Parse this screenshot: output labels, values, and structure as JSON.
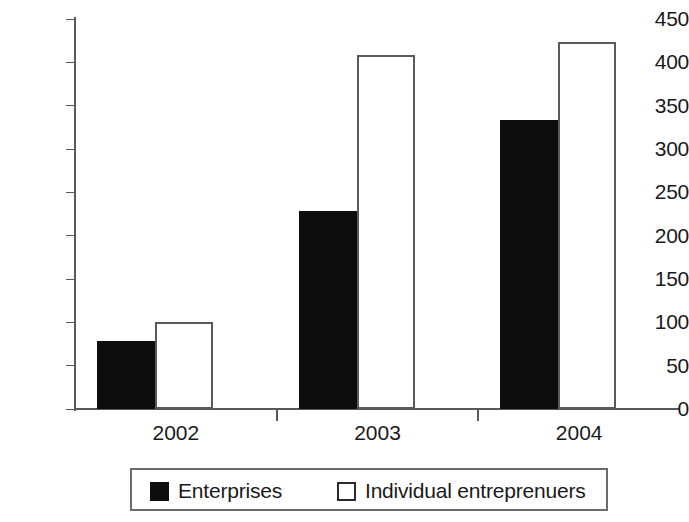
{
  "chart_data": {
    "type": "bar",
    "title": "",
    "subtitle": "",
    "xlabel": "",
    "ylabel": "",
    "categories": [
      "2002",
      "2003",
      "2004"
    ],
    "series": [
      {
        "name": "Enterprises",
        "values": [
          78,
          228,
          333
        ],
        "color": "#0d0d0d",
        "style": "filled"
      },
      {
        "name": "Individual entreprenuers",
        "values": [
          100,
          408,
          424
        ],
        "color": "#ffffff",
        "style": "outline"
      }
    ],
    "ylim": [
      0,
      450
    ],
    "ytick_values": [
      0,
      50,
      100,
      150,
      200,
      250,
      300,
      350,
      400,
      450
    ],
    "ytick_labels": [
      "0",
      "50",
      "100",
      "150",
      "200",
      "250",
      "300",
      "350",
      "400",
      "450"
    ],
    "grid": false,
    "legend_position": "bottom",
    "legend_entries": [
      {
        "label": "Enterprises",
        "swatch": "filled-square-icon"
      },
      {
        "label": "Individual entreprenuers",
        "swatch": "outline-square-icon"
      }
    ]
  },
  "colors": {
    "axis": "#58585a",
    "text": "#1a1a1a",
    "bar_filled": "#0d0d0d",
    "bar_outline_border": "#5a5a5c",
    "legend_border": "#6b6b6d",
    "background": "#ffffff"
  }
}
